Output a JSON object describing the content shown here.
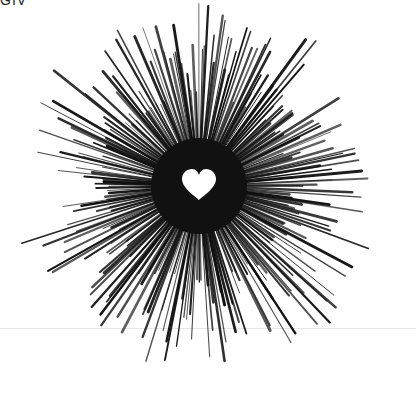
{
  "image": {
    "subject": "black radial starburst lines around a white heart",
    "top_partial_text": "GIV",
    "center": {
      "x": 199,
      "y": 186
    },
    "ray_count": 260,
    "inner_radius": 14,
    "outer_radius_min": 90,
    "outer_radius_max": 190,
    "ray_color": "#111111",
    "heart_color": "#ffffff",
    "background": "#ffffff"
  }
}
